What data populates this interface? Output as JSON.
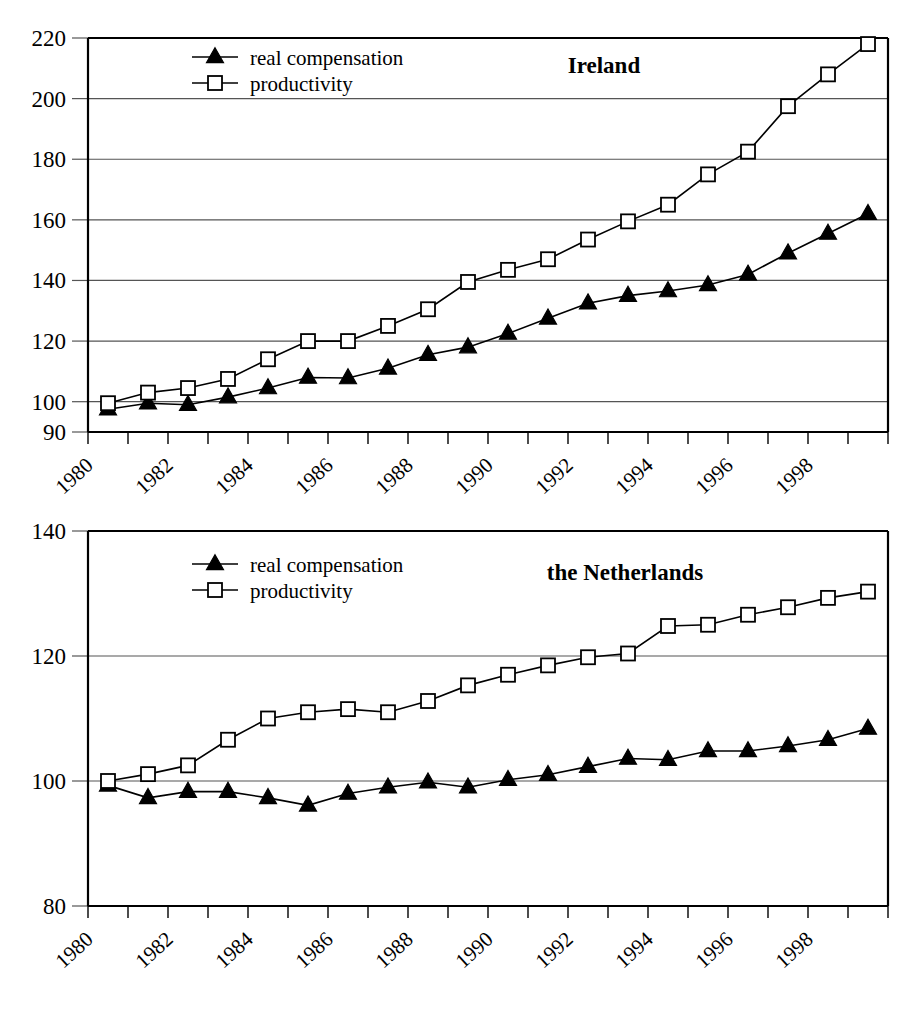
{
  "figure": {
    "background_color": "#ffffff",
    "ink_color": "#000000",
    "grid_color": "#555555",
    "panels": [
      "Ireland",
      "the Netherlands"
    ]
  },
  "legend": {
    "entries": [
      {
        "label": "real compensation",
        "marker": "filled-triangle-marker"
      },
      {
        "label": "productivity",
        "marker": "open-square-marker"
      }
    ]
  },
  "chart_data": [
    {
      "type": "line",
      "title": "Ireland",
      "xlabel": "",
      "ylabel": "",
      "xlim": [
        1980,
        2000
      ],
      "ylim": [
        90,
        220
      ],
      "yticks": [
        90,
        100,
        120,
        140,
        160,
        180,
        200,
        220
      ],
      "ytick_labels": [
        "90",
        "100",
        "120",
        "140",
        "160",
        "180",
        "200",
        "220"
      ],
      "xticks": [
        1980,
        1982,
        1984,
        1986,
        1988,
        1990,
        1992,
        1994,
        1996,
        1998
      ],
      "xtick_labels": [
        "1980",
        "1982",
        "1984",
        "1986",
        "1988",
        "1990",
        "1992",
        "1994",
        "1996",
        "1998"
      ],
      "grid": true,
      "legend_position": "top-left-inside",
      "x": [
        1980.5,
        1981.5,
        1982.5,
        1983.5,
        1984.5,
        1985.5,
        1986.5,
        1987.5,
        1988.5,
        1989.5,
        1990.5,
        1991.5,
        1992.5,
        1993.5,
        1994.5,
        1995.5,
        1996.5,
        1997.5,
        1998.5,
        1999.5
      ],
      "series": [
        {
          "name": "real compensation",
          "marker": "filled-triangle-marker",
          "values": [
            97.5,
            99.5,
            99.0,
            101.5,
            104.5,
            108.0,
            107.8,
            111.0,
            115.5,
            118.0,
            122.5,
            127.5,
            132.5,
            135.0,
            136.5,
            138.5,
            142.0,
            149.0,
            155.5,
            162.0
          ]
        },
        {
          "name": "productivity",
          "marker": "open-square-marker",
          "values": [
            99.5,
            103.0,
            104.5,
            107.5,
            114.0,
            120.0,
            120.0,
            125.0,
            130.5,
            139.5,
            143.5,
            147.0,
            153.5,
            159.5,
            165.0,
            175.0,
            182.5,
            197.5,
            208.0,
            218.0
          ]
        }
      ]
    },
    {
      "type": "line",
      "title": "the Netherlands",
      "xlabel": "",
      "ylabel": "",
      "xlim": [
        1980,
        2000
      ],
      "ylim": [
        80,
        140
      ],
      "yticks": [
        80,
        100,
        120,
        140
      ],
      "ytick_labels": [
        "80",
        "100",
        "120",
        "140"
      ],
      "xticks": [
        1980,
        1982,
        1984,
        1986,
        1988,
        1990,
        1992,
        1994,
        1996,
        1998
      ],
      "xtick_labels": [
        "1980",
        "1982",
        "1984",
        "1986",
        "1988",
        "1990",
        "1992",
        "1994",
        "1996",
        "1998"
      ],
      "grid": true,
      "legend_position": "top-left-inside",
      "x": [
        1980.5,
        1981.5,
        1982.5,
        1983.5,
        1984.5,
        1985.5,
        1986.5,
        1987.5,
        1988.5,
        1989.5,
        1990.5,
        1991.5,
        1992.5,
        1993.5,
        1994.5,
        1995.5,
        1996.5,
        1997.5,
        1998.5,
        1999.5
      ],
      "series": [
        {
          "name": "real compensation",
          "marker": "filled-triangle-marker",
          "values": [
            99.3,
            97.3,
            98.3,
            98.3,
            97.3,
            96.1,
            98.0,
            99.0,
            99.8,
            99.0,
            100.2,
            101.0,
            102.3,
            103.6,
            103.4,
            104.8,
            104.8,
            105.6,
            106.6,
            108.4
          ]
        },
        {
          "name": "productivity",
          "marker": "open-square-marker",
          "values": [
            100.0,
            101.1,
            102.5,
            106.6,
            110.0,
            111.0,
            111.5,
            111.0,
            112.8,
            115.3,
            117.0,
            118.5,
            119.8,
            120.4,
            124.8,
            125.0,
            126.6,
            127.8,
            129.3,
            130.3
          ]
        }
      ]
    }
  ]
}
